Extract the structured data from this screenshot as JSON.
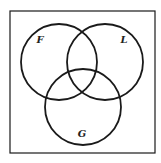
{
  "diagram": {
    "type": "venn",
    "frame": {
      "x": 10,
      "y": 11,
      "width": 145,
      "height": 142
    },
    "sets": [
      {
        "label": "F",
        "cx": 59,
        "cy": 62,
        "r": 38,
        "label_x": 40,
        "label_y": 43
      },
      {
        "label": "L",
        "cx": 105,
        "cy": 62,
        "r": 38,
        "label_x": 124,
        "label_y": 43
      },
      {
        "label": "G",
        "cx": 83,
        "cy": 107,
        "r": 38,
        "label_x": 82,
        "label_y": 137
      }
    ],
    "stroke_color": "#1a1a1a"
  }
}
